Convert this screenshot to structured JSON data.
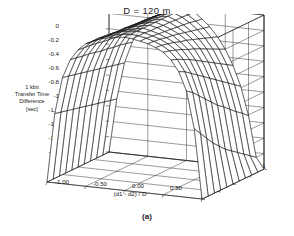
{
  "figure": {
    "title": "D = 120 m",
    "caption": "(a)"
  },
  "chart_data": {
    "type": "surface",
    "title": "D = 120 m",
    "subtitle": "",
    "xlabel": "(d1 - d2) / D",
    "ylabel": "(d1 + d2) / D - 1",
    "zlabel": "1 kbit Transfer Time Difference [sec]",
    "zlabel_lines": [
      "1 kbit",
      "Transfer Time",
      "Difference",
      "[sec]"
    ],
    "grid": true,
    "legend": "none",
    "xlim": [
      -1.0,
      1.0
    ],
    "ylim": [
      0.0,
      1.0
    ],
    "zlim": [
      -2.0,
      0.0
    ],
    "xticks": [
      "-1.00",
      "-0.50",
      "0.00",
      "0.50",
      "1.00"
    ],
    "xtick_values": [
      -1.0,
      -0.5,
      0.0,
      0.5,
      1.0
    ],
    "yticks": [
      "0.00",
      "0.25",
      "0.50",
      "0.75",
      "1.00"
    ],
    "ytick_values": [
      0.0,
      0.25,
      0.5,
      0.75,
      1.0
    ],
    "zticks": [
      "0",
      "-0.2",
      "-0.4",
      "-0.6",
      "-0.8",
      "-1",
      "-1.2",
      "-1.4",
      "-1.6",
      "-1.8",
      "-2"
    ],
    "ztick_values": [
      0,
      -0.2,
      -0.4,
      -0.6,
      -0.8,
      -1.0,
      -1.2,
      -1.4,
      -1.6,
      -1.8,
      -2.0
    ],
    "x": [
      -1.0,
      -0.9,
      -0.8,
      -0.7,
      -0.6,
      -0.5,
      -0.4,
      -0.3,
      -0.2,
      -0.1,
      0.0,
      0.1,
      0.2,
      0.3,
      0.4,
      0.5,
      0.6,
      0.7,
      0.8,
      0.9,
      1.0
    ],
    "y": [
      0.0,
      0.1,
      0.2,
      0.3,
      0.4,
      0.5,
      0.6,
      0.7,
      0.8,
      0.9,
      1.0
    ],
    "z_surface": [
      [
        -2.0,
        -1.1,
        -0.62,
        -0.38,
        -0.24,
        -0.15,
        -0.1,
        -0.06,
        -0.04,
        -0.02,
        -0.01,
        -0.02,
        -0.04,
        -0.06,
        -0.1,
        -0.15,
        -0.24,
        -0.38,
        -0.62,
        -1.1,
        -2.0
      ],
      [
        -2.0,
        -1.12,
        -0.64,
        -0.39,
        -0.25,
        -0.16,
        -0.1,
        -0.07,
        -0.04,
        -0.02,
        -0.01,
        -0.02,
        -0.04,
        -0.07,
        -0.11,
        -0.17,
        -0.27,
        -0.42,
        -0.68,
        -1.2,
        -2.0
      ],
      [
        -2.0,
        -1.14,
        -0.66,
        -0.41,
        -0.26,
        -0.17,
        -0.11,
        -0.07,
        -0.04,
        -0.02,
        -0.01,
        -0.02,
        -0.05,
        -0.08,
        -0.13,
        -0.2,
        -0.31,
        -0.48,
        -0.76,
        -1.3,
        -2.0
      ],
      [
        -2.0,
        -1.16,
        -0.68,
        -0.42,
        -0.27,
        -0.18,
        -0.12,
        -0.08,
        -0.05,
        -0.03,
        -0.01,
        -0.03,
        -0.06,
        -0.1,
        -0.15,
        -0.23,
        -0.35,
        -0.54,
        -0.84,
        -1.4,
        -2.0
      ],
      [
        -2.0,
        -1.18,
        -0.7,
        -0.44,
        -0.29,
        -0.19,
        -0.13,
        -0.08,
        -0.05,
        -0.03,
        -0.01,
        -0.03,
        -0.07,
        -0.11,
        -0.18,
        -0.27,
        -0.4,
        -0.6,
        -0.92,
        -1.48,
        -2.0
      ],
      [
        -2.0,
        -1.2,
        -0.72,
        -0.46,
        -0.3,
        -0.2,
        -0.13,
        -0.09,
        -0.05,
        -0.03,
        -0.01,
        -0.04,
        -0.08,
        -0.13,
        -0.2,
        -0.3,
        -0.45,
        -0.66,
        -1.0,
        -1.56,
        -2.0
      ],
      [
        -2.0,
        -1.22,
        -0.74,
        -0.47,
        -0.31,
        -0.21,
        -0.14,
        -0.09,
        -0.06,
        -0.03,
        -0.01,
        -0.04,
        -0.09,
        -0.15,
        -0.23,
        -0.34,
        -0.5,
        -0.72,
        -1.06,
        -1.62,
        -2.0
      ],
      [
        -2.0,
        -1.24,
        -0.76,
        -0.49,
        -0.32,
        -0.22,
        -0.15,
        -0.1,
        -0.06,
        -0.03,
        -0.01,
        -0.05,
        -0.1,
        -0.17,
        -0.26,
        -0.38,
        -0.55,
        -0.78,
        -1.13,
        -1.68,
        -2.0
      ],
      [
        -2.0,
        -1.26,
        -0.78,
        -0.5,
        -0.34,
        -0.23,
        -0.15,
        -0.1,
        -0.06,
        -0.03,
        -0.01,
        -0.05,
        -0.11,
        -0.19,
        -0.29,
        -0.42,
        -0.6,
        -0.84,
        -1.2,
        -1.74,
        -2.0
      ],
      [
        -2.0,
        -1.28,
        -0.8,
        -0.52,
        -0.35,
        -0.24,
        -0.16,
        -0.11,
        -0.07,
        -0.04,
        -0.01,
        -0.06,
        -0.13,
        -0.21,
        -0.32,
        -0.46,
        -0.65,
        -0.9,
        -1.26,
        -1.8,
        -2.0
      ],
      [
        -2.0,
        -1.3,
        -0.82,
        -0.54,
        -0.36,
        -0.25,
        -0.17,
        -0.11,
        -0.07,
        -0.04,
        -0.01,
        -0.06,
        -0.14,
        -0.23,
        -0.35,
        -0.5,
        -0.7,
        -0.96,
        -1.33,
        -1.86,
        -2.0
      ]
    ],
    "annotations": []
  }
}
